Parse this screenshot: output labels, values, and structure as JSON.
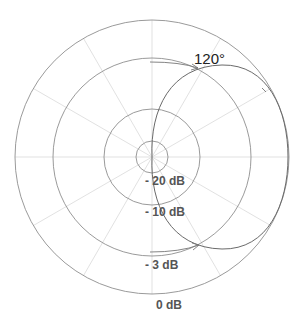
{
  "diagram": {
    "type": "polar-pattern",
    "center": [
      152,
      157
    ],
    "ring_labels": [
      {
        "label": "- 20 dB",
        "radius": 16
      },
      {
        "label": "- 10 dB",
        "radius": 48
      },
      {
        "label": "- 3 dB",
        "radius": 99
      },
      {
        "label": "0 dB",
        "radius": 137
      }
    ],
    "radial_spacing_deg": 30,
    "angle_label": "120°",
    "colors": {
      "grid_ring": "#8a8a8a",
      "grid_spoke": "#d6d6d6",
      "pattern": "#6e6e6e",
      "label": "#555555",
      "angle_label": "#222222"
    }
  },
  "labels": {
    "ring_20": "- 20 dB",
    "ring_10": "- 10 dB",
    "ring_3": "- 3 dB",
    "ring_0": "0 dB",
    "angle": "120°"
  }
}
